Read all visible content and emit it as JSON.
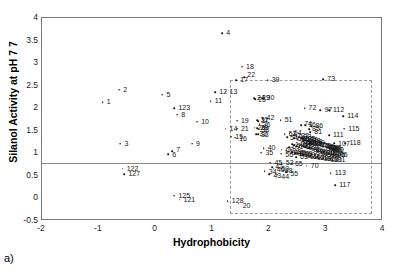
{
  "panel": {
    "label": "a)"
  },
  "chart_data": {
    "type": "scatter",
    "title": "",
    "xlabel": "Hydrophobicity",
    "ylabel": "Silanol Activity at pH 7 7",
    "xlim": [
      -2,
      4
    ],
    "ylim": [
      -0.5,
      4
    ],
    "xticks": [
      "-2",
      "-1",
      "0",
      "1",
      "2",
      "3",
      "4"
    ],
    "yticks": [
      "-0.5",
      "0",
      "0.5",
      "1",
      "1.5",
      "2",
      "2.5",
      "3",
      "3.5",
      "4"
    ],
    "grid": false,
    "legend": null,
    "annotations": [
      {
        "kind": "threshold-line",
        "orientation": "horizontal",
        "y": 0.78
      },
      {
        "kind": "selection-box",
        "x0": 1.3,
        "x1": 3.8,
        "y0": -0.34,
        "y1": 2.62
      }
    ],
    "point_label_prefix": "•",
    "points": [
      {
        "label": "4",
        "x": 1.17,
        "y": 3.66
      },
      {
        "label": "18",
        "x": 1.52,
        "y": 2.92
      },
      {
        "label": "17",
        "x": 1.42,
        "y": 2.62
      },
      {
        "label": "22",
        "x": 1.56,
        "y": 2.69
      },
      {
        "label": "39",
        "x": 1.97,
        "y": 2.62
      },
      {
        "label": "73",
        "x": 2.95,
        "y": 2.64
      },
      {
        "label": "2",
        "x": -0.64,
        "y": 2.41
      },
      {
        "label": "5",
        "x": 0.12,
        "y": 2.3
      },
      {
        "label": "12",
        "x": 1.05,
        "y": 2.35
      },
      {
        "label": "13",
        "x": 1.23,
        "y": 2.37
      },
      {
        "label": "1",
        "x": -0.93,
        "y": 2.13
      },
      {
        "label": "11",
        "x": 0.97,
        "y": 2.16
      },
      {
        "label": "123",
        "x": 0.33,
        "y": 2.0
      },
      {
        "label": "8",
        "x": 0.38,
        "y": 1.86
      },
      {
        "label": "10",
        "x": 0.73,
        "y": 1.7
      },
      {
        "label": "19",
        "x": 1.43,
        "y": 1.72
      },
      {
        "label": "14",
        "x": 1.23,
        "y": 1.55
      },
      {
        "label": "21",
        "x": 1.43,
        "y": 1.55
      },
      {
        "label": "15",
        "x": 1.33,
        "y": 1.37
      },
      {
        "label": "16",
        "x": 1.4,
        "y": 1.35
      },
      {
        "label": "24",
        "x": 1.73,
        "y": 2.22
      },
      {
        "label": "25",
        "x": 1.75,
        "y": 2.2
      },
      {
        "label": "29",
        "x": 1.82,
        "y": 2.23
      },
      {
        "label": "30",
        "x": 1.88,
        "y": 2.22
      },
      {
        "label": "3",
        "x": -0.62,
        "y": 1.21
      },
      {
        "label": "42",
        "x": 1.88,
        "y": 1.78
      },
      {
        "label": "31",
        "x": 1.79,
        "y": 1.74
      },
      {
        "label": "37",
        "x": 1.8,
        "y": 1.71
      },
      {
        "label": "36",
        "x": 1.83,
        "y": 1.64
      },
      {
        "label": "26",
        "x": 1.74,
        "y": 1.57
      },
      {
        "label": "28",
        "x": 1.79,
        "y": 1.56
      },
      {
        "label": "38",
        "x": 1.81,
        "y": 1.55
      },
      {
        "label": "32",
        "x": 1.77,
        "y": 1.43
      },
      {
        "label": "33",
        "x": 1.8,
        "y": 1.42
      },
      {
        "label": "51",
        "x": 2.2,
        "y": 1.74
      },
      {
        "label": "52",
        "x": 2.27,
        "y": 1.42
      },
      {
        "label": "64",
        "x": 2.36,
        "y": 1.44
      },
      {
        "label": "74",
        "x": 2.56,
        "y": 1.62
      },
      {
        "label": "76",
        "x": 2.63,
        "y": 1.62
      },
      {
        "label": "72",
        "x": 2.62,
        "y": 2.0
      },
      {
        "label": "97",
        "x": 2.9,
        "y": 1.95
      },
      {
        "label": "112",
        "x": 3.05,
        "y": 1.95
      },
      {
        "label": "114",
        "x": 3.3,
        "y": 1.82
      },
      {
        "label": "115",
        "x": 3.32,
        "y": 1.55
      },
      {
        "label": "111",
        "x": 3.05,
        "y": 1.4
      },
      {
        "label": "118",
        "x": 3.34,
        "y": 1.23
      },
      {
        "label": "107",
        "x": 3.14,
        "y": 1.22
      },
      {
        "label": "86",
        "x": 2.74,
        "y": 1.6
      },
      {
        "label": "85",
        "x": 2.7,
        "y": 1.53
      },
      {
        "label": "81",
        "x": 2.72,
        "y": 1.47
      },
      {
        "label": "40",
        "x": 1.9,
        "y": 1.12
      },
      {
        "label": "35",
        "x": 1.86,
        "y": 1.01
      },
      {
        "label": "60",
        "x": 2.22,
        "y": 1.08
      },
      {
        "label": "56",
        "x": 2.21,
        "y": 0.99
      },
      {
        "label": "69",
        "x": 2.35,
        "y": 1.13
      },
      {
        "label": "63",
        "x": 2.47,
        "y": 0.92
      },
      {
        "label": "6",
        "x": 0.22,
        "y": 0.98
      },
      {
        "label": "7",
        "x": 0.29,
        "y": 1.05
      },
      {
        "label": "9",
        "x": 0.64,
        "y": 1.21
      },
      {
        "label": "45",
        "x": 2.02,
        "y": 0.79
      },
      {
        "label": "53",
        "x": 2.22,
        "y": 0.79
      },
      {
        "label": "65",
        "x": 2.38,
        "y": 0.77
      },
      {
        "label": "70",
        "x": 2.66,
        "y": 0.73
      },
      {
        "label": "47",
        "x": 2.05,
        "y": 0.69
      },
      {
        "label": "46",
        "x": 2.08,
        "y": 0.66
      },
      {
        "label": "50",
        "x": 2.16,
        "y": 0.68
      },
      {
        "label": "48",
        "x": 2.22,
        "y": 0.66
      },
      {
        "label": "34",
        "x": 1.92,
        "y": 0.61
      },
      {
        "label": "43",
        "x": 2.0,
        "y": 0.54
      },
      {
        "label": "44",
        "x": 2.14,
        "y": 0.53
      },
      {
        "label": "55",
        "x": 2.3,
        "y": 0.58
      },
      {
        "label": "113",
        "x": 3.08,
        "y": 0.56
      },
      {
        "label": "117",
        "x": 3.16,
        "y": 0.3
      },
      {
        "label": "122",
        "x": -0.58,
        "y": 0.66
      },
      {
        "label": "127",
        "x": -0.55,
        "y": 0.54
      },
      {
        "label": "125",
        "x": 0.33,
        "y": 0.06
      },
      {
        "label": "121",
        "x": 0.42,
        "y": -0.03
      },
      {
        "label": "128",
        "x": 1.27,
        "y": -0.06
      },
      {
        "label": "20",
        "x": 1.46,
        "y": -0.12
      },
      {
        "label": "54",
        "x": 2.31,
        "y": 1.36
      },
      {
        "label": "58",
        "x": 2.44,
        "y": 1.33
      },
      {
        "label": "59",
        "x": 2.5,
        "y": 1.31
      },
      {
        "label": "61",
        "x": 2.55,
        "y": 1.28
      },
      {
        "label": "62",
        "x": 2.6,
        "y": 1.26
      },
      {
        "label": "66",
        "x": 2.66,
        "y": 1.25
      },
      {
        "label": "67",
        "x": 2.7,
        "y": 1.23
      },
      {
        "label": "68",
        "x": 2.74,
        "y": 1.22
      },
      {
        "label": "71",
        "x": 2.78,
        "y": 1.21
      },
      {
        "label": "75",
        "x": 2.82,
        "y": 1.2
      },
      {
        "label": "77",
        "x": 2.86,
        "y": 1.19
      },
      {
        "label": "78",
        "x": 2.9,
        "y": 1.18
      },
      {
        "label": "79",
        "x": 2.93,
        "y": 1.17
      },
      {
        "label": "80",
        "x": 2.96,
        "y": 1.16
      },
      {
        "label": "82",
        "x": 2.99,
        "y": 1.15
      },
      {
        "label": "83",
        "x": 3.01,
        "y": 1.14
      },
      {
        "label": "84",
        "x": 3.04,
        "y": 1.13
      },
      {
        "label": "87",
        "x": 3.06,
        "y": 1.12
      },
      {
        "label": "88",
        "x": 3.08,
        "y": 1.11
      },
      {
        "label": "89",
        "x": 3.1,
        "y": 1.1
      },
      {
        "label": "90",
        "x": 3.12,
        "y": 1.09
      },
      {
        "label": "91",
        "x": 2.55,
        "y": 1.19
      },
      {
        "label": "92",
        "x": 2.6,
        "y": 1.16
      },
      {
        "label": "93",
        "x": 2.64,
        "y": 1.14
      },
      {
        "label": "94",
        "x": 2.68,
        "y": 1.12
      },
      {
        "label": "95",
        "x": 2.72,
        "y": 1.1
      },
      {
        "label": "96",
        "x": 2.76,
        "y": 1.08
      },
      {
        "label": "98",
        "x": 2.8,
        "y": 1.06
      },
      {
        "label": "99",
        "x": 2.84,
        "y": 1.05
      },
      {
        "label": "100",
        "x": 2.88,
        "y": 1.04
      },
      {
        "label": "101",
        "x": 2.92,
        "y": 1.03
      },
      {
        "label": "102",
        "x": 2.96,
        "y": 1.02
      },
      {
        "label": "103",
        "x": 3.0,
        "y": 1.01
      },
      {
        "label": "104",
        "x": 3.04,
        "y": 1.0
      },
      {
        "label": "105",
        "x": 3.08,
        "y": 0.99
      },
      {
        "label": "106",
        "x": 3.12,
        "y": 0.98
      },
      {
        "label": "108",
        "x": 2.5,
        "y": 1.01
      },
      {
        "label": "109",
        "x": 2.55,
        "y": 0.98
      },
      {
        "label": "110",
        "x": 2.6,
        "y": 0.96
      },
      {
        "label": "116",
        "x": 2.66,
        "y": 0.94
      },
      {
        "label": "119",
        "x": 2.72,
        "y": 0.93
      },
      {
        "label": "120",
        "x": 2.78,
        "y": 0.92
      },
      {
        "label": "124",
        "x": 2.84,
        "y": 0.91
      },
      {
        "label": "126",
        "x": 2.9,
        "y": 0.9
      },
      {
        "label": "129",
        "x": 2.96,
        "y": 0.89
      },
      {
        "label": "130",
        "x": 3.02,
        "y": 0.88
      },
      {
        "label": "131",
        "x": 3.08,
        "y": 0.87
      },
      {
        "label": "132",
        "x": 2.44,
        "y": 1.4
      },
      {
        "label": "133",
        "x": 2.48,
        "y": 1.38
      },
      {
        "label": "134",
        "x": 2.52,
        "y": 1.35
      },
      {
        "label": "135",
        "x": 2.56,
        "y": 1.33
      },
      {
        "label": "136",
        "x": 2.6,
        "y": 1.31
      },
      {
        "label": "137",
        "x": 2.64,
        "y": 1.29
      },
      {
        "label": "138",
        "x": 2.68,
        "y": 1.27
      },
      {
        "label": "139",
        "x": 2.72,
        "y": 1.25
      },
      {
        "label": "140",
        "x": 2.4,
        "y": 1.2
      },
      {
        "label": "141",
        "x": 2.44,
        "y": 1.18
      },
      {
        "label": "142",
        "x": 2.48,
        "y": 1.16
      },
      {
        "label": "143",
        "x": 2.3,
        "y": 1.06
      },
      {
        "label": "144",
        "x": 2.35,
        "y": 1.04
      },
      {
        "label": "145",
        "x": 2.4,
        "y": 1.02
      },
      {
        "label": "146",
        "x": 2.45,
        "y": 1.0
      }
    ],
    "label_offsets": {
      "4": [
        4,
        -4
      ],
      "18": [
        4,
        -4
      ],
      "17": [
        4,
        -4
      ],
      "22": [
        3,
        -6
      ],
      "39": [
        4,
        -4
      ],
      "73": [
        4,
        -4
      ],
      "2": [
        4,
        -4
      ],
      "5": [
        4,
        -4
      ],
      "12": [
        4,
        -4
      ],
      "13": [
        4,
        -4
      ],
      "1": [
        4,
        -4
      ],
      "11": [
        4,
        -4
      ],
      "123": [
        4,
        -4
      ],
      "8": [
        4,
        -4
      ],
      "10": [
        4,
        -4
      ],
      "19": [
        4,
        -4
      ],
      "14": [
        4,
        -4
      ],
      "21": [
        4,
        -4
      ],
      "15": [
        4,
        -4
      ],
      "16": [
        4,
        -3
      ],
      "3": [
        4,
        -4
      ],
      "6": [
        4,
        -3
      ],
      "7": [
        4,
        -5
      ],
      "9": [
        4,
        -4
      ],
      "122": [
        4,
        -4
      ],
      "127": [
        4,
        -4
      ],
      "125": [
        4,
        -4
      ],
      "121": [
        4,
        -4
      ],
      "128": [
        4,
        -4
      ],
      "20": [
        4,
        -2
      ],
      "113": [
        4,
        -4
      ],
      "117": [
        4,
        -4
      ],
      "114": [
        4,
        -4
      ],
      "115": [
        4,
        -4
      ],
      "118": [
        4,
        -4
      ],
      "111": [
        4,
        -4
      ],
      "112": [
        4,
        -4
      ],
      "97": [
        4,
        -4
      ],
      "72": [
        4,
        -4
      ],
      "51": [
        4,
        -4
      ],
      "70": [
        4,
        -4
      ],
      "65": [
        4,
        -4
      ],
      "63": [
        4,
        -4
      ],
      "40": [
        4,
        -4
      ],
      "35": [
        4,
        -4
      ],
      "45": [
        4,
        -4
      ],
      "53": [
        4,
        -4
      ],
      "34": [
        4,
        -3
      ],
      "43": [
        4,
        -2
      ],
      "44": [
        4,
        -2
      ],
      "55": [
        4,
        -2
      ],
      "52": [
        4,
        -4
      ],
      "64": [
        4,
        -4
      ],
      "74": [
        3,
        -5
      ],
      "76": [
        3,
        -4
      ],
      "86": [
        4,
        -4
      ],
      "85": [
        3,
        -4
      ],
      "81": [
        4,
        -4
      ],
      "42": [
        4,
        -4
      ],
      "31": [
        3,
        -4
      ],
      "37": [
        3,
        -4
      ],
      "36": [
        3,
        -3
      ],
      "26": [
        3,
        -4
      ],
      "28": [
        3,
        -4
      ],
      "38": [
        3,
        -3
      ],
      "32": [
        3,
        -4
      ],
      "33": [
        3,
        -3
      ],
      "24": [
        3,
        -4
      ],
      "25": [
        3,
        -3
      ],
      "29": [
        3,
        -4
      ],
      "30": [
        4,
        -4
      ],
      "60": [
        4,
        -4
      ],
      "56": [
        4,
        -3
      ],
      "69": [
        3,
        -4
      ],
      "47": [
        3,
        -4
      ],
      "46": [
        3,
        -3
      ],
      "50": [
        3,
        -3
      ],
      "48": [
        3,
        -2
      ],
      "107": [
        4,
        -3
      ],
      "54": [
        3,
        -3
      ],
      "58": [
        3,
        -3
      ],
      "59": [
        3,
        -3
      ],
      "61": [
        3,
        -3
      ],
      "62": [
        3,
        -3
      ],
      "66": [
        3,
        -3
      ],
      "67": [
        3,
        -3
      ],
      "68": [
        3,
        -3
      ],
      "71": [
        3,
        -3
      ],
      "75": [
        3,
        -3
      ],
      "77": [
        3,
        -3
      ],
      "78": [
        3,
        -3
      ],
      "79": [
        3,
        -3
      ],
      "80": [
        3,
        -3
      ],
      "82": [
        3,
        -3
      ],
      "83": [
        3,
        -3
      ],
      "84": [
        3,
        -3
      ],
      "87": [
        3,
        -3
      ],
      "88": [
        3,
        -3
      ],
      "89": [
        3,
        -3
      ],
      "90": [
        3,
        -3
      ],
      "91": [
        3,
        -3
      ],
      "92": [
        3,
        -3
      ],
      "93": [
        3,
        -3
      ],
      "94": [
        3,
        -3
      ],
      "95": [
        3,
        -3
      ],
      "96": [
        3,
        -3
      ],
      "98": [
        3,
        -3
      ],
      "99": [
        3,
        -3
      ],
      "100": [
        3,
        -3
      ],
      "101": [
        3,
        -3
      ],
      "102": [
        3,
        -3
      ],
      "103": [
        3,
        -3
      ],
      "104": [
        3,
        -3
      ],
      "105": [
        3,
        -3
      ],
      "106": [
        3,
        -3
      ],
      "108": [
        3,
        -3
      ],
      "109": [
        3,
        -3
      ],
      "110": [
        3,
        -3
      ],
      "116": [
        3,
        -3
      ],
      "119": [
        3,
        -3
      ],
      "120": [
        3,
        -3
      ],
      "124": [
        3,
        -3
      ],
      "126": [
        3,
        -3
      ],
      "129": [
        3,
        -3
      ],
      "130": [
        3,
        -3
      ],
      "131": [
        3,
        -3
      ],
      "132": [
        3,
        -3
      ],
      "133": [
        3,
        -3
      ],
      "134": [
        3,
        -3
      ],
      "135": [
        3,
        -3
      ],
      "136": [
        3,
        -3
      ],
      "137": [
        3,
        -3
      ],
      "138": [
        3,
        -3
      ],
      "139": [
        3,
        -3
      ],
      "140": [
        3,
        -3
      ],
      "141": [
        3,
        -3
      ],
      "142": [
        3,
        -3
      ],
      "143": [
        3,
        -3
      ],
      "144": [
        3,
        -3
      ],
      "145": [
        3,
        -3
      ],
      "146": [
        3,
        -3
      ]
    }
  }
}
